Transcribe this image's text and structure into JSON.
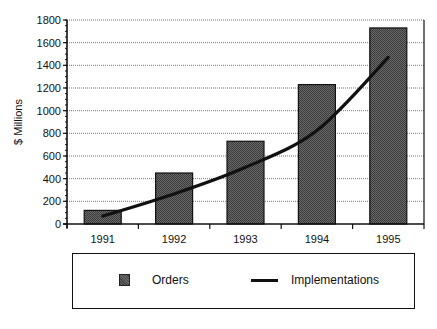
{
  "chart_data": {
    "type": "bar",
    "title": "",
    "xlabel": "",
    "ylabel": "$ Millions",
    "categories": [
      "1991",
      "1992",
      "1993",
      "1994",
      "1995"
    ],
    "series": [
      {
        "name": "Orders",
        "type": "bar",
        "values": [
          120,
          450,
          730,
          1230,
          1730
        ],
        "color": "#555555"
      },
      {
        "name": "Implementations",
        "type": "line",
        "values": [
          70,
          265,
          500,
          825,
          1470
        ],
        "color": "#111111"
      }
    ],
    "ylim": [
      0,
      1800
    ],
    "yticks": [
      0,
      200,
      400,
      600,
      800,
      1000,
      1200,
      1400,
      1600,
      1800
    ],
    "grid": true,
    "legend_position": "bottom"
  },
  "legend": {
    "items": [
      {
        "label": "Orders"
      },
      {
        "label": "Implementations"
      }
    ]
  }
}
